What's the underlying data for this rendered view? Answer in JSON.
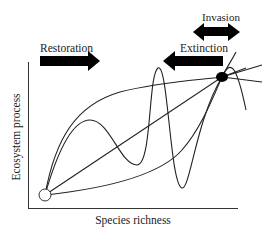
{
  "diagram": {
    "arrows": {
      "restoration": {
        "label": "Restoration",
        "direction": "right"
      },
      "extinction": {
        "label": "Extinction",
        "direction": "left"
      },
      "invasion": {
        "label": "Invasion",
        "direction": "both"
      }
    },
    "axes": {
      "x_label": "Species richness",
      "y_label": "Ecosystem process"
    },
    "points": {
      "start": {
        "style": "open-circle"
      },
      "end": {
        "style": "filled-ellipse"
      }
    },
    "colors": {
      "line": "#222222",
      "background": "#ffffff"
    }
  }
}
